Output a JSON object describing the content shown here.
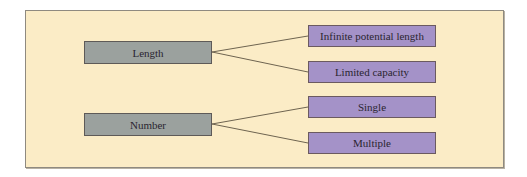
{
  "diagram": {
    "colors": {
      "background": "#fbecc6",
      "category_fill": "#9ba19e",
      "leaf_fill": "#a492c8",
      "connector": "#6e6450"
    },
    "categories": [
      {
        "label": "Length",
        "children": [
          "Infinite potential length",
          "Limited capacity"
        ]
      },
      {
        "label": "Number",
        "children": [
          "Single",
          "Multiple"
        ]
      }
    ]
  }
}
